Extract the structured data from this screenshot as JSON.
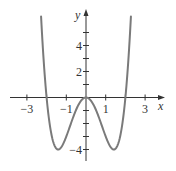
{
  "chart_data": {
    "type": "line",
    "title": "",
    "function": "f(x) = x^4 - 4x^2",
    "xlabel": "x",
    "ylabel": "y",
    "xlim": [
      -3.9,
      4.0
    ],
    "ylim": [
      -4.6,
      6.9
    ],
    "grid": false,
    "legend": null,
    "x_ticks": [
      -3,
      -2,
      -1,
      0,
      1,
      2,
      3
    ],
    "x_tick_labels": [
      {
        "value": -3,
        "label": "−3"
      },
      {
        "value": -1,
        "label": "−1"
      },
      {
        "value": 1,
        "label": "1"
      },
      {
        "value": 3,
        "label": "3"
      }
    ],
    "y_ticks": [
      -4,
      -3,
      -2,
      -1,
      1,
      2,
      3,
      4,
      5
    ],
    "y_tick_labels": [
      {
        "value": 4,
        "label": "4"
      },
      {
        "value": 2,
        "label": "2"
      },
      {
        "value": -4,
        "label": "−4"
      }
    ],
    "series": [
      {
        "name": "curve",
        "color": "#7a7a7a",
        "x": [
          -2.28,
          -2.2,
          -2.0,
          -1.8,
          -1.6,
          -1.414,
          -1.2,
          -1.0,
          -0.8,
          -0.6,
          -0.4,
          -0.2,
          0,
          0.2,
          0.4,
          0.6,
          0.8,
          1.0,
          1.2,
          1.414,
          1.6,
          1.8,
          2.0,
          2.2,
          2.28
        ],
        "y": [
          6.23,
          4.07,
          0,
          -2.46,
          -3.69,
          -4.0,
          -3.69,
          -3.0,
          -2.15,
          -1.31,
          -0.61,
          -0.16,
          0,
          -0.16,
          -0.61,
          -1.31,
          -2.15,
          -3.0,
          -3.69,
          -4.0,
          -3.69,
          -2.46,
          0,
          4.07,
          6.23
        ]
      }
    ],
    "key_points": {
      "zeros": [
        -2,
        0,
        2
      ],
      "local_minima": [
        {
          "x": -1.414,
          "y": -4
        },
        {
          "x": 1.414,
          "y": -4
        }
      ],
      "local_maximum": {
        "x": 0,
        "y": 0
      }
    }
  },
  "layout": {
    "origin_px": [
      86,
      97.5
    ],
    "px_per_unit_x": 19.7,
    "px_per_unit_y": 13,
    "axis_color": "#333333",
    "curve_color": "#7a7a7a"
  },
  "labels": {
    "x_axis": "x",
    "y_axis": "y"
  }
}
